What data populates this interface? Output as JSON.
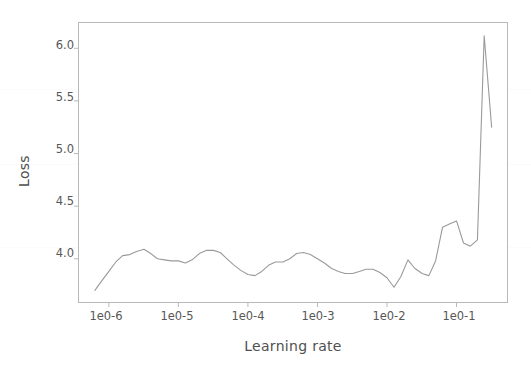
{
  "figure": {
    "background_color": "#ffffff",
    "axes_frame_color": "#b9b9b9",
    "line_color": "#9a9a9a",
    "text_color": "#505050"
  },
  "axis": {
    "ylabel": "Loss",
    "xlabel": "Learning rate",
    "yticks": [
      "4.0",
      "4.5",
      "5.0",
      "5.5",
      "6.0"
    ],
    "xticks": [
      "1e0-6",
      "1e0-5",
      "1e0-4",
      "1e0-3",
      "1e0-2",
      "1e0-1"
    ]
  },
  "chart_data": {
    "type": "line",
    "title": "",
    "xlabel": "Learning rate",
    "ylabel": "Loss",
    "xscale": "log",
    "grid": false,
    "legend": null,
    "xlim": [
      3.6e-07,
      0.55
    ],
    "ylim": [
      3.58,
      6.25
    ],
    "xtick_values": [
      1e-06,
      1e-05,
      0.0001,
      0.001,
      0.01,
      0.1
    ],
    "xtick_labels": [
      "1e0-6",
      "1e0-5",
      "1e0-4",
      "1e0-3",
      "1e0-2",
      "1e0-1"
    ],
    "ytick_values": [
      4.0,
      4.5,
      5.0,
      5.5,
      6.0
    ],
    "ytick_labels": [
      "4.0",
      "4.5",
      "5.0",
      "5.5",
      "6.0"
    ],
    "series": [
      {
        "name": "loss",
        "color": "#9a9a9a",
        "x": [
          6.3e-07,
          7.9e-07,
          1e-06,
          1.26e-06,
          1.58e-06,
          2e-06,
          2.5e-06,
          3.2e-06,
          4e-06,
          5e-06,
          6.3e-06,
          7.9e-06,
          1e-05,
          1.26e-05,
          1.58e-05,
          2e-05,
          2.5e-05,
          3.2e-05,
          4e-05,
          5e-05,
          6.3e-05,
          7.9e-05,
          0.0001,
          0.000126,
          0.000158,
          0.0002,
          0.00025,
          0.00032,
          0.0004,
          0.0005,
          0.00063,
          0.00079,
          0.001,
          0.00126,
          0.00158,
          0.002,
          0.0025,
          0.0032,
          0.004,
          0.005,
          0.0063,
          0.0079,
          0.01,
          0.0126,
          0.0158,
          0.02,
          0.025,
          0.032,
          0.04,
          0.05,
          0.063,
          0.079,
          0.1,
          0.126,
          0.158,
          0.2,
          0.25,
          0.32
        ],
        "y": [
          3.7,
          3.79,
          3.88,
          3.97,
          4.03,
          4.04,
          4.07,
          4.09,
          4.05,
          4.0,
          3.99,
          3.98,
          3.98,
          3.96,
          3.99,
          4.05,
          4.08,
          4.08,
          4.06,
          4.0,
          3.94,
          3.89,
          3.85,
          3.84,
          3.88,
          3.94,
          3.97,
          3.97,
          4.0,
          4.05,
          4.06,
          4.04,
          4.0,
          3.96,
          3.91,
          3.88,
          3.86,
          3.86,
          3.88,
          3.9,
          3.9,
          3.87,
          3.82,
          3.73,
          3.83,
          3.99,
          3.91,
          3.86,
          3.84,
          3.98,
          4.3,
          4.33,
          4.36,
          4.15,
          4.12,
          4.18,
          6.12,
          5.25
        ]
      }
    ],
    "annotations": [
      {
        "text": "peak loss",
        "x": 0.25,
        "y": 6.12
      },
      {
        "text": "minimum region",
        "x": 0.0126,
        "y": 3.73
      }
    ]
  }
}
